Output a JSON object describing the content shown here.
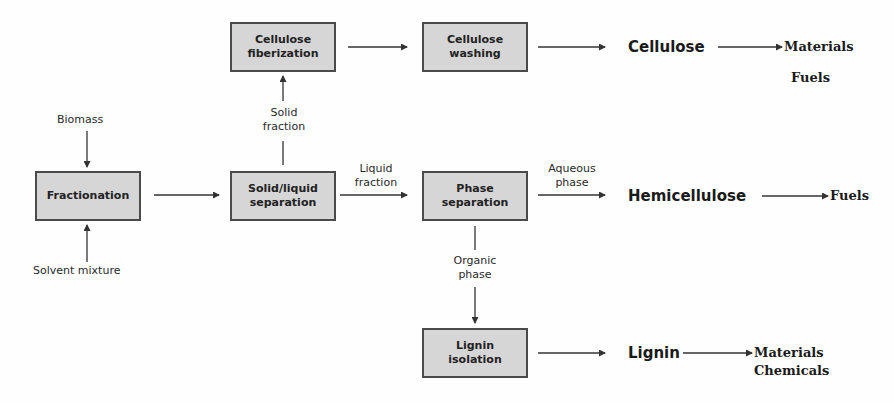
{
  "diagram": {
    "nodes": {
      "fractionation": "Fractionation",
      "cellulose_fiberization": "Cellulose fiberization",
      "solid_liquid_separation": "Solid/liquid separation",
      "cellulose_washing": "Cellulose washing",
      "phase_separation": "Phase separation",
      "lignin_isolation": "Lignin isolation"
    },
    "node_lines": {
      "fractionation": [
        "Fractionation"
      ],
      "cellulose_fiberization": [
        "Cellulose",
        "fiberization"
      ],
      "solid_liquid_separation": [
        "Solid/liquid",
        "separation"
      ],
      "cellulose_washing": [
        "Cellulose",
        "washing"
      ],
      "phase_separation": [
        "Phase",
        "separation"
      ],
      "lignin_isolation": [
        "Lignin",
        "isolation"
      ]
    },
    "inputs": {
      "biomass": "Biomass",
      "solvent_mixture": "Solvent mixture"
    },
    "edge_labels": {
      "solid_fraction": [
        "Solid",
        "fraction"
      ],
      "liquid_fraction": [
        "Liquid",
        "fraction"
      ],
      "aqueous_phase": [
        "Aqueous",
        "phase"
      ],
      "organic_phase": [
        "Organic",
        "phase"
      ]
    },
    "products": {
      "cellulose": "Cellulose",
      "hemicellulose": "Hemicellulose",
      "lignin": "Lignin"
    },
    "uses": {
      "cellulose": [
        "Materials",
        "Fuels"
      ],
      "hemicellulose": [
        "Fuels"
      ],
      "lignin": [
        "Materials",
        "Chemicals"
      ]
    },
    "edges": [
      {
        "from": "Biomass",
        "to": "Fractionation"
      },
      {
        "from": "Solvent mixture",
        "to": "Fractionation"
      },
      {
        "from": "Fractionation",
        "to": "Solid/liquid separation"
      },
      {
        "from": "Solid/liquid separation",
        "to": "Cellulose fiberization",
        "label": "Solid fraction"
      },
      {
        "from": "Solid/liquid separation",
        "to": "Phase separation",
        "label": "Liquid fraction"
      },
      {
        "from": "Cellulose fiberization",
        "to": "Cellulose washing"
      },
      {
        "from": "Cellulose washing",
        "to": "Cellulose"
      },
      {
        "from": "Phase separation",
        "to": "Hemicellulose",
        "label": "Aqueous phase"
      },
      {
        "from": "Phase separation",
        "to": "Lignin isolation",
        "label": "Organic phase"
      },
      {
        "from": "Lignin isolation",
        "to": "Lignin"
      },
      {
        "from": "Cellulose",
        "to": "Materials / Fuels"
      },
      {
        "from": "Hemicellulose",
        "to": "Fuels"
      },
      {
        "from": "Lignin",
        "to": "Materials / Chemicals"
      }
    ],
    "colors": {
      "box_fill": "#d6d6d6",
      "box_border": "#4a4a4a",
      "line": "#333333",
      "background": "#fefefe"
    }
  }
}
